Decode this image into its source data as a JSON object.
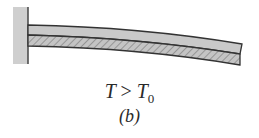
{
  "figure": {
    "condition": {
      "lhs": "T",
      "op": ">",
      "rhs": "T",
      "rhs_subscript": "0"
    },
    "panel_label": "(b)",
    "colors": {
      "wall": "#cfcfcf",
      "strip_top": "#c8c8c8",
      "strip_bottom": "#b5b5b5",
      "outline": "#333333"
    }
  }
}
